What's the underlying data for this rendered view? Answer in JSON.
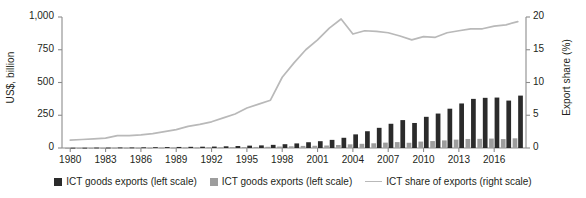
{
  "chart": {
    "type": "combo",
    "y_left_title": "US$, billion",
    "y_right_title": "Export share (%)",
    "x_tick_labels": [
      "1980",
      "1983",
      "1986",
      "1989",
      "1992",
      "1995",
      "1998",
      "2001",
      "2004",
      "2007",
      "2010",
      "2013",
      "2016"
    ],
    "y_left_ticks": [
      "0",
      "250",
      "500",
      "750",
      "1,000"
    ],
    "y_right_ticks": [
      "0",
      "5",
      "10",
      "15",
      "20"
    ]
  },
  "legend": {
    "items": [
      {
        "name": "ict-goods-exports-dark",
        "label": "ICT goods exports (left scale)",
        "marker": "square",
        "color": "#2b2b2b"
      },
      {
        "name": "ict-goods-exports-light",
        "label": "ICT goods exports (left scale)",
        "marker": "square",
        "color": "#9d9d9d"
      },
      {
        "name": "ict-share-of-exports",
        "label": "ICT share of exports (right scale)",
        "marker": "line",
        "color": "#b9b9b9"
      }
    ]
  },
  "chart_data": {
    "type": "bar",
    "title": "",
    "xlabel": "",
    "ylabel": "US$, billion",
    "y2label": "Export share (%)",
    "grid": false,
    "legend_position": "bottom",
    "xlim": [
      1979.3,
      2018.7
    ],
    "ylim": [
      0,
      1000
    ],
    "y2lim": [
      0,
      20
    ],
    "xticks": [
      1980,
      1983,
      1986,
      1989,
      1992,
      1995,
      1998,
      2001,
      2004,
      2007,
      2010,
      2013,
      2016
    ],
    "yticks": [
      0,
      250,
      500,
      750,
      1000
    ],
    "y2ticks": [
      0,
      5,
      10,
      15,
      20
    ],
    "categories": [
      1980,
      1981,
      1982,
      1983,
      1984,
      1985,
      1986,
      1987,
      1988,
      1989,
      1990,
      1991,
      1992,
      1993,
      1994,
      1995,
      1996,
      1997,
      1998,
      1999,
      2000,
      2001,
      2002,
      2003,
      2004,
      2005,
      2006,
      2007,
      2008,
      2009,
      2010,
      2011,
      2012,
      2013,
      2014,
      2015,
      2016,
      2017,
      2018
    ],
    "series": [
      {
        "name": "ICT goods exports (left scale)",
        "axis": "left",
        "kind": "bar",
        "color": "#2b2b2b",
        "unit": "US$ billion",
        "values": [
          2,
          2,
          3,
          3,
          4,
          4,
          5,
          6,
          7,
          8,
          9,
          10,
          11,
          13,
          15,
          18,
          20,
          24,
          29,
          35,
          44,
          52,
          62,
          78,
          104,
          128,
          154,
          185,
          213,
          191,
          238,
          263,
          300,
          340,
          375,
          383,
          385,
          362,
          400
        ]
      },
      {
        "name": "ICT goods exports (left scale)",
        "axis": "left",
        "kind": "bar",
        "color": "#9d9d9d",
        "unit": "US$ billion",
        "values": [
          1,
          1,
          1,
          1,
          2,
          2,
          2,
          2,
          3,
          3,
          4,
          4,
          5,
          5,
          6,
          7,
          8,
          9,
          11,
          13,
          16,
          17,
          19,
          23,
          28,
          32,
          36,
          41,
          45,
          40,
          49,
          53,
          58,
          64,
          69,
          70,
          72,
          68,
          74
        ]
      },
      {
        "name": "ICT share of exports (right scale)",
        "axis": "right",
        "kind": "line",
        "color": "#b9b9b9",
        "unit": "%",
        "values": [
          1.2,
          1.3,
          1.4,
          1.5,
          1.9,
          1.9,
          2.0,
          2.2,
          2.5,
          2.8,
          3.3,
          3.6,
          4.0,
          4.6,
          5.2,
          6.1,
          6.7,
          7.3,
          10.8,
          13.0,
          15.0,
          16.5,
          18.3,
          19.7,
          17.4,
          17.9,
          17.8,
          17.6,
          17.1,
          16.5,
          17.0,
          16.9,
          17.6,
          17.9,
          18.2,
          18.2,
          18.6,
          18.8,
          19.3
        ]
      }
    ]
  }
}
